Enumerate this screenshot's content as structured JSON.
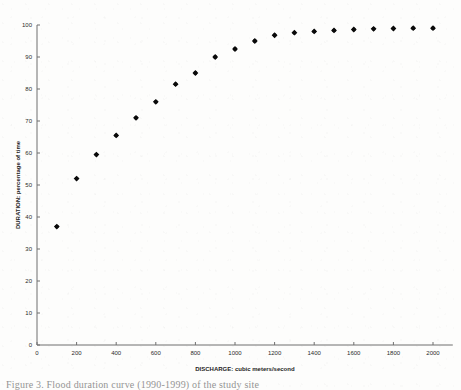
{
  "figure": {
    "caption": "Figure 3. Flood duration curve (1990-1999) of the study site"
  },
  "chart_data": {
    "type": "scatter",
    "title": "",
    "xlabel": "DISCHARGE: cubic meters/second",
    "ylabel": "DURATION: percentage of time",
    "xlim": [
      0,
      2100
    ],
    "ylim": [
      0,
      100
    ],
    "xticks": [
      0,
      200,
      400,
      600,
      800,
      1000,
      1200,
      1400,
      1600,
      1800,
      2000
    ],
    "xtick_labels": [
      "0",
      "200",
      "400",
      "600",
      "800",
      "1000",
      "1200",
      "1400",
      "1600",
      "1800",
      "2000"
    ],
    "yticks": [
      0,
      10,
      20,
      30,
      40,
      50,
      60,
      70,
      80,
      90,
      100
    ],
    "ytick_labels": [
      "0",
      "10",
      "20",
      "30",
      "40",
      "50",
      "60",
      "70",
      "80",
      "90",
      "100"
    ],
    "grid": false,
    "legend": null,
    "marker": "filled-diamond",
    "marker_color": "#0a0a0a",
    "x": [
      100,
      200,
      300,
      400,
      500,
      600,
      700,
      800,
      900,
      1000,
      1100,
      1200,
      1300,
      1400,
      1500,
      1600,
      1700,
      1800,
      1900,
      2000
    ],
    "y": [
      37.0,
      52.0,
      59.5,
      65.5,
      71.0,
      76.0,
      81.5,
      85.0,
      90.0,
      92.5,
      95.0,
      96.8,
      97.6,
      98.0,
      98.3,
      98.6,
      98.8,
      98.9,
      99.0,
      99.0
    ]
  }
}
